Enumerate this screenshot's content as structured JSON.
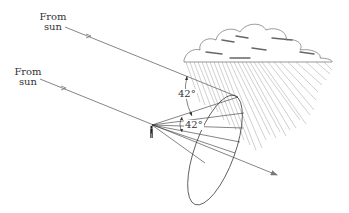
{
  "diagram": {
    "labels": {
      "top_sun": [
        "From",
        "sun"
      ],
      "bottom_sun": [
        "From",
        "sun"
      ],
      "angle_upper": "42°",
      "angle_lower": "42°"
    },
    "elements": [
      "sun-ray-top",
      "sun-ray-bottom",
      "observer",
      "cone-of-rays",
      "rainbow-ellipse",
      "cloud",
      "rain"
    ],
    "colors": {
      "ray": "#777777",
      "line": "#333333",
      "rain": "#999999",
      "cloud_shade": "#666666"
    }
  }
}
